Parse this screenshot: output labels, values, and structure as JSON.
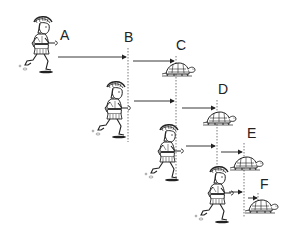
{
  "diagram": {
    "labels": {
      "a": "A",
      "b": "B",
      "c": "C",
      "d": "D",
      "e": "E",
      "f": "F"
    },
    "stages": [
      {
        "runner_at": "A",
        "runner_target": "B",
        "tortoise_from": "B",
        "tortoise_to": "C"
      },
      {
        "runner_at": "B",
        "runner_target": "C",
        "tortoise_from": "C",
        "tortoise_to": "D"
      },
      {
        "runner_at": "C",
        "runner_target": "D",
        "tortoise_from": "D",
        "tortoise_to": "E"
      },
      {
        "runner_at": "D",
        "runner_target": "E",
        "tortoise_from": "E",
        "tortoise_to": "F"
      }
    ],
    "colors": {
      "ink": "#222222",
      "background": "#ffffff"
    }
  }
}
